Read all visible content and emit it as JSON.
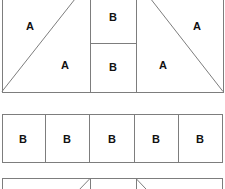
{
  "figure": {
    "type": "patchwork-piecing-diagram",
    "background_color": "#ffffff",
    "line_color": "#7d7d7d",
    "label_color": "#111111",
    "width": 225,
    "height": 189
  },
  "labels": {
    "a": "A",
    "b": "B"
  },
  "bands": [
    {
      "name": "top-band",
      "clipped": "top",
      "y_top": -20,
      "y_bottom": 92,
      "units": [
        {
          "name": "left-square",
          "x": 2,
          "width": 88,
          "kind": "half-square-triangles",
          "diagonal": "bottom-left-to-top-right",
          "pieces": [
            {
              "label": "A",
              "cx": 30,
              "cy": 27
            },
            {
              "label": "A",
              "cx": 65,
              "cy": 65
            }
          ]
        },
        {
          "name": "center-column",
          "x": 90,
          "width": 46,
          "kind": "stacked-rectangles",
          "split_y": 43,
          "pieces": [
            {
              "label": "B",
              "cx": 113,
              "cy": 18
            },
            {
              "label": "B",
              "cx": 113,
              "cy": 67
            }
          ]
        },
        {
          "name": "right-square",
          "x": 136,
          "width": 87,
          "kind": "half-square-triangles",
          "diagonal": "top-left-to-bottom-right",
          "pieces": [
            {
              "label": "A",
              "cx": 197,
              "cy": 27
            },
            {
              "label": "A",
              "cx": 163,
              "cy": 65
            }
          ]
        }
      ]
    },
    {
      "name": "middle-band",
      "clipped": "none",
      "y_top": 114,
      "y_bottom": 163,
      "units": [
        {
          "name": "strip-row",
          "x": 2,
          "width": 221,
          "kind": "rectangle-strip",
          "dividers": [
            45,
            89,
            134,
            178
          ],
          "pieces": [
            {
              "label": "B",
              "cx": 23,
              "cy": 139
            },
            {
              "label": "B",
              "cx": 67,
              "cy": 139
            },
            {
              "label": "B",
              "cx": 112,
              "cy": 139
            },
            {
              "label": "B",
              "cx": 156,
              "cy": 139
            },
            {
              "label": "B",
              "cx": 200,
              "cy": 139
            }
          ]
        }
      ]
    },
    {
      "name": "bottom-band",
      "clipped": "bottom",
      "y_top": 178,
      "y_bottom": 270,
      "units": [
        {
          "name": "left-square",
          "x": 2,
          "width": 88,
          "kind": "half-square-triangles",
          "diagonal": "bottom-left-to-top-right",
          "pieces": []
        },
        {
          "name": "center-column",
          "x": 90,
          "width": 46,
          "kind": "stacked-rectangles",
          "split_y": 221,
          "pieces": []
        },
        {
          "name": "right-square",
          "x": 136,
          "width": 87,
          "kind": "half-square-triangles",
          "diagonal": "top-left-to-bottom-right",
          "pieces": []
        }
      ]
    }
  ]
}
